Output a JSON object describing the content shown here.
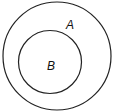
{
  "diagram": {
    "type": "venn-subset",
    "sets": [
      {
        "label": "A",
        "cx": 57,
        "cy": 56,
        "r": 54
      },
      {
        "label": "B",
        "cx": 50,
        "cy": 62,
        "r": 31.5
      }
    ],
    "stroke_color": "#222222",
    "background": "#ffffff"
  }
}
